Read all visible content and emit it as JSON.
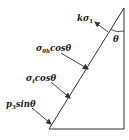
{
  "diagram": {
    "type": "force-triangle",
    "colors": {
      "stroke": "#333333",
      "text": "#222222",
      "background": "#ffffff"
    },
    "angle_label": "θ",
    "forces": [
      {
        "id": "k-sigma1",
        "base": "kσ",
        "sub": "1",
        "suffix": ""
      },
      {
        "id": "sigma-theta-h-cos",
        "base": "σ",
        "sub": "θh",
        "suffix": "cosθ"
      },
      {
        "id": "sigma-t-cos",
        "base": "σ",
        "sub": "t",
        "suffix": "cosθ"
      },
      {
        "id": "p3-sin",
        "base": "p",
        "sub": "3",
        "suffix": "sinθ"
      }
    ]
  }
}
